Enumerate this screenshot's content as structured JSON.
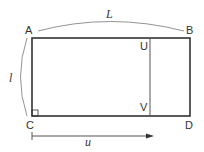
{
  "diagram": {
    "title": "",
    "points": {
      "A": {
        "label": "A"
      },
      "B": {
        "label": "B"
      },
      "C": {
        "label": "C"
      },
      "D": {
        "label": "D"
      },
      "U": {
        "label": "U"
      },
      "V": {
        "label": "V"
      }
    },
    "dimensions": {
      "length_label": "L",
      "width_label": "l",
      "displacement_label": "u"
    },
    "colors": {
      "stroke": "#333333",
      "thin_stroke": "#777777",
      "background": "#ffffff"
    }
  }
}
